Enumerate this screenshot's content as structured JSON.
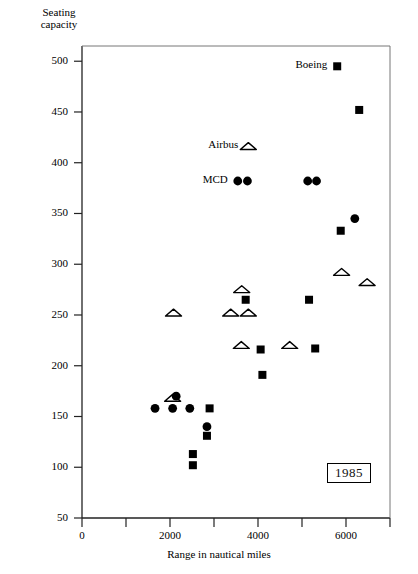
{
  "chart_data": {
    "type": "scatter",
    "title": "",
    "xlabel": "Range in nautical miles",
    "ylabel": "Seating capacity",
    "annotation": "1985",
    "xlim": [
      0,
      7000
    ],
    "ylim": [
      50,
      515
    ],
    "grid": false,
    "legend_position": "inline-left-of-point",
    "xticks": [
      0,
      2000,
      4000,
      6000
    ],
    "xtick_labels": [
      "0",
      "2000",
      "4000",
      "6000"
    ],
    "xminor_ticks": [
      1000,
      3000,
      5000,
      7000
    ],
    "yticks": [
      50,
      100,
      150,
      200,
      250,
      300,
      350,
      400,
      450,
      500
    ],
    "ytick_labels": [
      "50",
      "100",
      "150",
      "200",
      "250",
      "300",
      "350",
      "400",
      "450",
      "500"
    ],
    "series": [
      {
        "name": "Boeing",
        "marker": "filled-square",
        "color": "#000000",
        "points": [
          {
            "x": 2900,
            "y": 158
          },
          {
            "x": 2520,
            "y": 113
          },
          {
            "x": 2520,
            "y": 102
          },
          {
            "x": 2840,
            "y": 131
          },
          {
            "x": 4100,
            "y": 191
          },
          {
            "x": 4060,
            "y": 216
          },
          {
            "x": 3720,
            "y": 265
          },
          {
            "x": 5160,
            "y": 265
          },
          {
            "x": 5300,
            "y": 217
          },
          {
            "x": 5880,
            "y": 333
          },
          {
            "x": 5800,
            "y": 495
          },
          {
            "x": 6300,
            "y": 452
          }
        ]
      },
      {
        "name": "Airbus",
        "marker": "open-triangle",
        "color": "#000000",
        "points": [
          {
            "x": 2060,
            "y": 168
          },
          {
            "x": 2080,
            "y": 252
          },
          {
            "x": 3380,
            "y": 252
          },
          {
            "x": 3780,
            "y": 252
          },
          {
            "x": 3630,
            "y": 275
          },
          {
            "x": 3620,
            "y": 220
          },
          {
            "x": 4720,
            "y": 220
          },
          {
            "x": 5900,
            "y": 292
          },
          {
            "x": 6480,
            "y": 282
          }
        ]
      },
      {
        "name": "MCD",
        "marker": "filled-circle",
        "color": "#000000",
        "points": [
          {
            "x": 1660,
            "y": 158
          },
          {
            "x": 2060,
            "y": 158
          },
          {
            "x": 2450,
            "y": 158
          },
          {
            "x": 2140,
            "y": 170
          },
          {
            "x": 2840,
            "y": 140
          },
          {
            "x": 3540,
            "y": 382
          },
          {
            "x": 3760,
            "y": 382
          },
          {
            "x": 5130,
            "y": 382
          },
          {
            "x": 5330,
            "y": 382
          },
          {
            "x": 6200,
            "y": 345
          }
        ]
      }
    ],
    "inline_legend": [
      {
        "label": "Boeing",
        "marker": "filled-square",
        "x": 5800,
        "y": 495
      },
      {
        "label": "Airbus",
        "marker": "open-triangle",
        "x": 3780,
        "y": 416
      },
      {
        "label": "MCD",
        "marker": "filled-circle",
        "x": 3540,
        "y": 382
      }
    ]
  }
}
